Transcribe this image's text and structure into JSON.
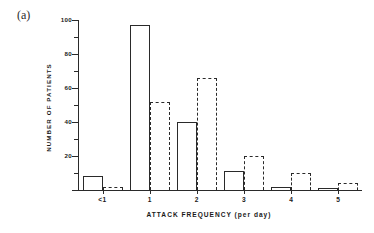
{
  "panel": {
    "label": "(a)"
  },
  "chart_data": {
    "type": "bar",
    "title": "",
    "xlabel": "ATTACK   FREQUENCY (per day)",
    "ylabel": "NUMBER  OF  PATIENTS",
    "categories": [
      "<1",
      "1",
      "2",
      "3",
      "4",
      "5"
    ],
    "ylim": [
      0,
      100
    ],
    "xlim_note": "categorical, bars offset: solid left, dashed right",
    "grid": false,
    "legend": "none",
    "y_major_ticks": [
      0,
      20,
      40,
      60,
      80,
      100
    ],
    "y_major_tick_labels": [
      "",
      "20",
      "40",
      "60",
      "80",
      "100"
    ],
    "y_minor_ticks": [
      10,
      30,
      50,
      70,
      90
    ],
    "series": [
      {
        "name": "solid-outline",
        "style": "solid",
        "values": [
          8,
          97,
          40,
          11,
          2,
          1
        ]
      },
      {
        "name": "dashed-outline",
        "style": "dashed",
        "values": [
          2,
          52,
          66,
          20,
          10,
          4
        ]
      }
    ]
  }
}
